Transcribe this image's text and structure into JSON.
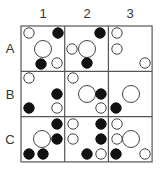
{
  "columns": [
    "1",
    "2",
    "3"
  ],
  "rows": [
    "A",
    "B",
    "C"
  ],
  "grid": {
    "left": 21,
    "top": 26,
    "cell_w": 43.7,
    "cell_h": 45.3
  },
  "colors": {
    "line": "#555555",
    "filled": "#111111",
    "open_stroke": "#444444",
    "open_fill": "#ffffff"
  },
  "radius": {
    "small": 5.2,
    "big": 8.5
  },
  "cells": [
    {
      "id": "A1",
      "circles": [
        {
          "x": 29,
          "y": 33,
          "size": "small",
          "filled": false
        },
        {
          "x": 58,
          "y": 33,
          "size": "small",
          "filled": true
        },
        {
          "x": 43,
          "y": 49,
          "size": "big",
          "filled": false
        },
        {
          "x": 41,
          "y": 64,
          "size": "small",
          "filled": true
        },
        {
          "x": 57,
          "y": 63,
          "size": "small",
          "filled": false
        }
      ]
    },
    {
      "id": "A2",
      "circles": [
        {
          "x": 100,
          "y": 33,
          "size": "small",
          "filled": true
        },
        {
          "x": 72,
          "y": 49,
          "size": "small",
          "filled": false
        },
        {
          "x": 87,
          "y": 49,
          "size": "big",
          "filled": false
        },
        {
          "x": 87,
          "y": 63,
          "size": "small",
          "filled": true
        }
      ]
    },
    {
      "id": "A3",
      "circles": [
        {
          "x": 117,
          "y": 33,
          "size": "small",
          "filled": false
        },
        {
          "x": 117,
          "y": 49,
          "size": "small",
          "filled": false
        },
        {
          "x": 145,
          "y": 63,
          "size": "small",
          "filled": false
        }
      ]
    },
    {
      "id": "B1",
      "circles": [
        {
          "x": 29,
          "y": 78,
          "size": "small",
          "filled": false
        },
        {
          "x": 57,
          "y": 94,
          "size": "small",
          "filled": true
        },
        {
          "x": 29,
          "y": 108,
          "size": "small",
          "filled": true
        },
        {
          "x": 57,
          "y": 108,
          "size": "small",
          "filled": false
        }
      ]
    },
    {
      "id": "B2",
      "circles": [
        {
          "x": 73,
          "y": 78,
          "size": "small",
          "filled": false
        },
        {
          "x": 87,
          "y": 94,
          "size": "big",
          "filled": false
        },
        {
          "x": 101,
          "y": 94,
          "size": "small",
          "filled": true
        },
        {
          "x": 101,
          "y": 108,
          "size": "small",
          "filled": false
        }
      ]
    },
    {
      "id": "B3",
      "circles": [
        {
          "x": 131,
          "y": 94,
          "size": "big",
          "filled": false
        },
        {
          "x": 116,
          "y": 108,
          "size": "small",
          "filled": true
        }
      ]
    },
    {
      "id": "C1",
      "circles": [
        {
          "x": 57,
          "y": 124,
          "size": "small",
          "filled": true
        },
        {
          "x": 42,
          "y": 139,
          "size": "big",
          "filled": false
        },
        {
          "x": 57,
          "y": 139,
          "size": "small",
          "filled": true
        },
        {
          "x": 29,
          "y": 154,
          "size": "small",
          "filled": true
        },
        {
          "x": 43,
          "y": 154,
          "size": "small",
          "filled": true
        }
      ]
    },
    {
      "id": "C2",
      "circles": [
        {
          "x": 73,
          "y": 124,
          "size": "small",
          "filled": false
        },
        {
          "x": 101,
          "y": 124,
          "size": "small",
          "filled": true
        },
        {
          "x": 73,
          "y": 139,
          "size": "small",
          "filled": false
        },
        {
          "x": 101,
          "y": 139,
          "size": "small",
          "filled": true
        },
        {
          "x": 87,
          "y": 154,
          "size": "small",
          "filled": true
        },
        {
          "x": 101,
          "y": 154,
          "size": "small",
          "filled": false
        }
      ]
    },
    {
      "id": "C3",
      "circles": [
        {
          "x": 117,
          "y": 124,
          "size": "small",
          "filled": false
        },
        {
          "x": 117,
          "y": 139,
          "size": "small",
          "filled": false
        },
        {
          "x": 131,
          "y": 139,
          "size": "big",
          "filled": false
        },
        {
          "x": 116,
          "y": 154,
          "size": "small",
          "filled": true
        },
        {
          "x": 145,
          "y": 154,
          "size": "small",
          "filled": false
        }
      ]
    }
  ]
}
